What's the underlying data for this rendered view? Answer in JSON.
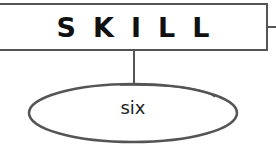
{
  "diagram": {
    "parent": {
      "label": "SKILL"
    },
    "child": {
      "label": "six"
    },
    "colors": {
      "stroke": "#555555",
      "text": "#111111",
      "background": "#ffffff"
    }
  }
}
